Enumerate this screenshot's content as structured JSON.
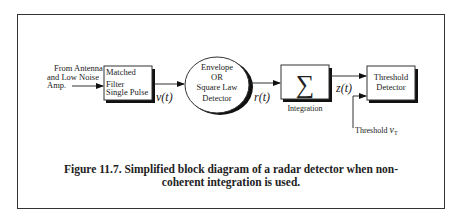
{
  "diagram": {
    "input_label": [
      "From Antenna",
      "and Low Noise",
      "Amp."
    ],
    "blocks": {
      "matched_filter": [
        "Matched",
        "Filter",
        "Single Pulse"
      ],
      "detector": [
        "Envelope",
        "OR",
        "Square Law",
        "Detector"
      ],
      "integrator_symbol": "∑",
      "integrator_label": "Integration",
      "threshold_detector": [
        "Threshold",
        "Detector"
      ]
    },
    "signals": {
      "v": "v(t)",
      "r": "r(t)",
      "z": "z(t)",
      "threshold": "Threshold ",
      "threshold_symbol": "v",
      "threshold_subscript": "T"
    }
  },
  "caption": {
    "line1": "Figure 11.7. Simplified block diagram of a radar detector when non-",
    "line2": "coherent integration is used."
  }
}
